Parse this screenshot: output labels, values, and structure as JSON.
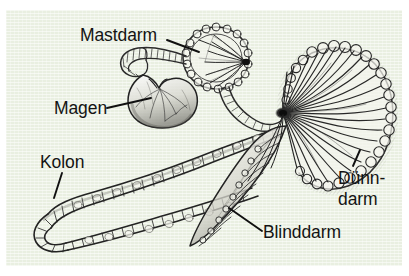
{
  "figure": {
    "panel_background_color": "#e9efe1",
    "ink_color": "#1a1a1a",
    "page_background_color": "#ffffff"
  },
  "labels": [
    {
      "id": "mastdarm",
      "text": "Mastdarm",
      "target": "rectum",
      "leader_line": true
    },
    {
      "id": "magen",
      "text": "Magen",
      "target": "stomach",
      "leader_line": true
    },
    {
      "id": "kolon",
      "text": "Kolon",
      "target": "colon",
      "leader_line": true
    },
    {
      "id": "duenndarm",
      "text_line1": "Dünn-",
      "text_line2": "darm",
      "target": "small-intestine",
      "leader_line": true
    },
    {
      "id": "blinddarm",
      "text": "Blinddarm",
      "target": "cecum",
      "leader_line": true
    }
  ],
  "structures": [
    {
      "id": "stomach",
      "name": "Magen"
    },
    {
      "id": "rectum",
      "name": "Mastdarm"
    },
    {
      "id": "colon",
      "name": "Kolon"
    },
    {
      "id": "cecum",
      "name": "Blinddarm"
    },
    {
      "id": "small-intestine",
      "name": "Dünndarm"
    }
  ]
}
